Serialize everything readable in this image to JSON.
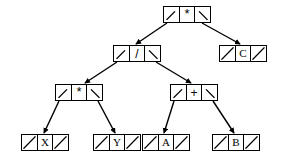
{
  "diagram": {
    "expression": "((X * Y) / (A + B)) * C",
    "canvas": {
      "width": 284,
      "height": 167,
      "background": "#ffffff"
    },
    "stroke_color": "#000000",
    "text_color": "#000000",
    "node_layout": {
      "cell_order": [
        "left-pointer",
        "data",
        "right-pointer"
      ],
      "null_pointer_glyph": "/",
      "live_pointer_glyph": "\\"
    },
    "nodes": [
      {
        "id": "root",
        "label": "*",
        "kind": "operator",
        "x": 163,
        "y": 6,
        "level": 0,
        "left_pointer": "link",
        "right_pointer": "link",
        "left_child": "div",
        "right_child": "leaf-c"
      },
      {
        "id": "div",
        "label": "/",
        "kind": "operator",
        "x": 113,
        "y": 45,
        "level": 1,
        "left_pointer": "link",
        "right_pointer": "link",
        "left_child": "mul",
        "right_child": "add"
      },
      {
        "id": "leaf-c",
        "label": "C",
        "kind": "operand",
        "x": 219,
        "y": 45,
        "level": 1,
        "left_pointer": "null",
        "right_pointer": "null",
        "left_child": null,
        "right_child": null
      },
      {
        "id": "mul",
        "label": "*",
        "kind": "operator",
        "x": 55,
        "y": 84,
        "level": 2,
        "left_pointer": "link",
        "right_pointer": "link",
        "left_child": "leaf-x",
        "right_child": "leaf-y"
      },
      {
        "id": "add",
        "label": "+",
        "kind": "operator",
        "x": 170,
        "y": 84,
        "level": 2,
        "left_pointer": "link",
        "right_pointer": "link",
        "left_child": "leaf-a",
        "right_child": "leaf-b"
      },
      {
        "id": "leaf-x",
        "label": "X",
        "kind": "operand",
        "x": 21,
        "y": 134,
        "level": 3,
        "left_pointer": "null",
        "right_pointer": "null",
        "left_child": null,
        "right_child": null
      },
      {
        "id": "leaf-y",
        "label": "Y",
        "kind": "operand",
        "x": 93,
        "y": 134,
        "level": 3,
        "left_pointer": "null",
        "right_pointer": "null",
        "left_child": null,
        "right_child": null
      },
      {
        "id": "leaf-a",
        "label": "A",
        "kind": "operand",
        "x": 142,
        "y": 134,
        "level": 3,
        "left_pointer": "null",
        "right_pointer": "null",
        "left_child": null,
        "right_child": null
      },
      {
        "id": "leaf-b",
        "label": "B",
        "kind": "operand",
        "x": 212,
        "y": 134,
        "level": 3,
        "left_pointer": "null",
        "right_pointer": "null",
        "left_child": null,
        "right_child": null
      }
    ],
    "edges": [
      {
        "id": "edge-root-div",
        "from": "root",
        "to": "div",
        "side": "left",
        "x1": 167,
        "y1": 23,
        "x2": 136,
        "y2": 44
      },
      {
        "id": "edge-root-c",
        "from": "root",
        "to": "leaf-c",
        "side": "right",
        "x1": 202,
        "y1": 23,
        "x2": 240,
        "y2": 44
      },
      {
        "id": "edge-div-mul",
        "from": "div",
        "to": "mul",
        "side": "left",
        "x1": 117,
        "y1": 62,
        "x2": 85,
        "y2": 83
      },
      {
        "id": "edge-div-add",
        "from": "div",
        "to": "add",
        "side": "right",
        "x1": 156,
        "y1": 62,
        "x2": 191,
        "y2": 83
      },
      {
        "id": "edge-mul-x",
        "from": "mul",
        "to": "leaf-x",
        "side": "left",
        "x1": 59,
        "y1": 101,
        "x2": 44,
        "y2": 133
      },
      {
        "id": "edge-mul-y",
        "from": "mul",
        "to": "leaf-y",
        "side": "right",
        "x1": 98,
        "y1": 101,
        "x2": 115,
        "y2": 133
      },
      {
        "id": "edge-add-a",
        "from": "add",
        "to": "leaf-a",
        "side": "left",
        "x1": 174,
        "y1": 101,
        "x2": 164,
        "y2": 133
      },
      {
        "id": "edge-add-b",
        "from": "add",
        "to": "leaf-b",
        "side": "right",
        "x1": 213,
        "y1": 101,
        "x2": 234,
        "y2": 133
      }
    ]
  }
}
